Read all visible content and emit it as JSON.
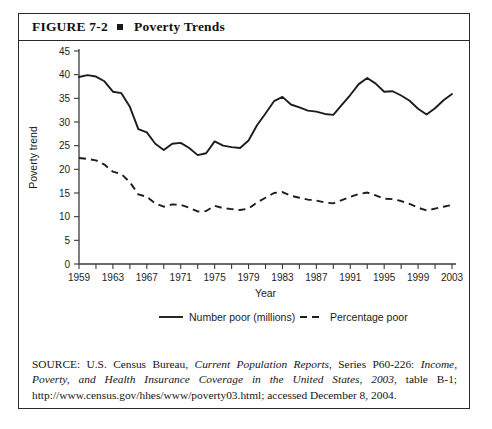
{
  "figure": {
    "label": "FIGURE 7-2",
    "bullet_icon": "square-bullet",
    "title": "Poverty Trends"
  },
  "source": {
    "prefix": "SOURCE: U.S. Census Bureau, ",
    "italic_1": "Current Population Reports",
    "middle_1": ", Series P60-226: ",
    "italic_2": "Income, Poverty, and Health Insurance Coverage in the United States, 2003",
    "middle_2": ", table B-1; http://www.census.gov/hhes/www/poverty03.html; accessed December 8, 2004."
  },
  "legend": {
    "position": "bottom-center",
    "entries": [
      {
        "label": "Number poor (millions)",
        "style": "solid"
      },
      {
        "label": "Percentage poor",
        "style": "dashed"
      }
    ]
  },
  "chart_data": {
    "type": "line",
    "title": "Poverty Trends",
    "xlabel": "Year",
    "ylabel": "Poverty trend",
    "xlim": [
      1959,
      2003
    ],
    "ylim": [
      0,
      45
    ],
    "yticks": [
      0,
      5,
      10,
      15,
      20,
      25,
      30,
      35,
      40,
      45
    ],
    "xticks": [
      1959,
      1961,
      1963,
      1965,
      1967,
      1969,
      1971,
      1973,
      1975,
      1977,
      1979,
      1981,
      1983,
      1985,
      1987,
      1989,
      1991,
      1993,
      1995,
      1997,
      1999,
      2001,
      2003
    ],
    "xticklabels": [
      1959,
      1963,
      1967,
      1971,
      1975,
      1979,
      1983,
      1987,
      1991,
      1995,
      1999,
      2003
    ],
    "grid": false,
    "x": [
      1959,
      1960,
      1961,
      1962,
      1963,
      1964,
      1965,
      1966,
      1967,
      1968,
      1969,
      1970,
      1971,
      1972,
      1973,
      1974,
      1975,
      1976,
      1977,
      1978,
      1979,
      1980,
      1981,
      1982,
      1983,
      1984,
      1985,
      1986,
      1987,
      1988,
      1989,
      1990,
      1991,
      1992,
      1993,
      1994,
      1995,
      1996,
      1997,
      1998,
      1999,
      2000,
      2001,
      2002,
      2003
    ],
    "series": [
      {
        "name": "Number poor (millions)",
        "style": "solid",
        "values": [
          39.5,
          39.9,
          39.6,
          38.6,
          36.4,
          36.1,
          33.2,
          28.5,
          27.8,
          25.4,
          24.1,
          25.4,
          25.6,
          24.5,
          23.0,
          23.4,
          25.9,
          25.0,
          24.7,
          24.5,
          26.1,
          29.3,
          31.8,
          34.4,
          35.3,
          33.7,
          33.1,
          32.4,
          32.2,
          31.7,
          31.5,
          33.6,
          35.7,
          38.0,
          39.3,
          38.1,
          36.4,
          36.5,
          35.6,
          34.5,
          32.8,
          31.6,
          32.9,
          34.6,
          35.9
        ]
      },
      {
        "name": "Percentage poor",
        "style": "dashed",
        "values": [
          22.4,
          22.2,
          21.9,
          21.0,
          19.5,
          19.0,
          17.3,
          14.7,
          14.2,
          12.8,
          12.1,
          12.6,
          12.5,
          11.9,
          11.1,
          11.2,
          12.3,
          11.8,
          11.6,
          11.4,
          11.7,
          13.0,
          14.0,
          15.0,
          15.2,
          14.4,
          14.0,
          13.6,
          13.4,
          13.0,
          12.8,
          13.5,
          14.2,
          14.8,
          15.1,
          14.5,
          13.8,
          13.7,
          13.3,
          12.7,
          11.9,
          11.3,
          11.7,
          12.1,
          12.5
        ]
      }
    ]
  }
}
